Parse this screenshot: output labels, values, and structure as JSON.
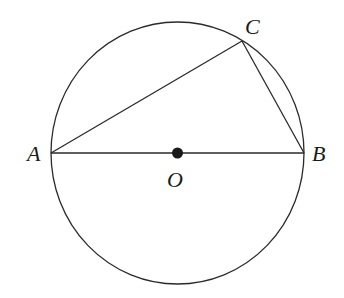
{
  "diagram": {
    "type": "circle-inscribed-triangle",
    "colors": {
      "stroke": "#2a2a2a",
      "text": "#1a1a1a",
      "background": "#ffffff",
      "center_dot": "#1a1a1a"
    },
    "circle": {
      "center": "O",
      "cx": 177.5,
      "cy": 153,
      "rx": 126.5,
      "ry": 131
    },
    "points": {
      "A": {
        "label": "A",
        "x": 51,
        "y": 153
      },
      "B": {
        "label": "B",
        "x": 304,
        "y": 153
      },
      "C": {
        "label": "C",
        "x": 242,
        "y": 41
      },
      "O": {
        "label": "O",
        "x": 177.5,
        "y": 153
      }
    },
    "segments": [
      {
        "name": "AB",
        "from": "A",
        "to": "B",
        "note": "diameter"
      },
      {
        "name": "AC",
        "from": "A",
        "to": "C"
      },
      {
        "name": "BC",
        "from": "B",
        "to": "C"
      }
    ],
    "labels": {
      "A": "A",
      "B": "B",
      "C": "C",
      "O": "O"
    }
  }
}
